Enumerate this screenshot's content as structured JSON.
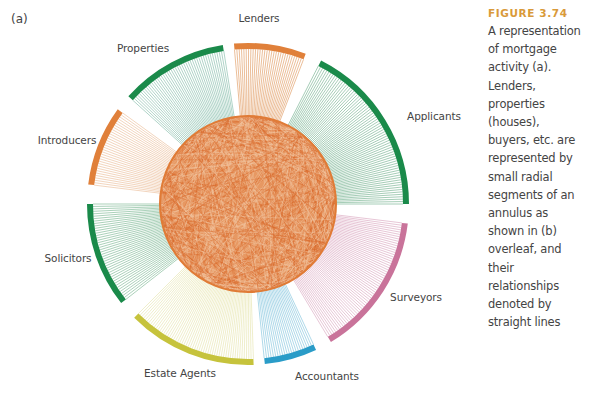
{
  "figure": {
    "panel_label": "(a)",
    "center": [
      248,
      204
    ],
    "inner_radius": 88,
    "outer_radius": 158,
    "arc_width": 6,
    "hub_color": "#e07b36",
    "segments": [
      {
        "name": "Lenders",
        "start": -95,
        "end": -69,
        "color": "#e0803a",
        "spoke_color": "#e2a26d",
        "spokes": 30,
        "label_pos": [
          259,
          18
        ]
      },
      {
        "name": "Applicants",
        "start": -63,
        "end": 0,
        "color": "#1a8a4a",
        "spoke_color": "#7fb898",
        "spokes": 70,
        "label_pos": [
          434,
          116
        ]
      },
      {
        "name": "Surveyors",
        "start": 7,
        "end": 59,
        "color": "#c9739a",
        "spoke_color": "#dcaec4",
        "spokes": 60,
        "label_pos": [
          416,
          297
        ]
      },
      {
        "name": "Accountants",
        "start": 65,
        "end": 84,
        "color": "#2a9cc8",
        "spoke_color": "#8cc8e0",
        "spokes": 22,
        "label_pos": [
          327,
          376
        ]
      },
      {
        "name": "Estate Agents",
        "start": 88,
        "end": 135,
        "color": "#c6c33c",
        "spoke_color": "#e8e6b4",
        "spokes": 55,
        "label_pos": [
          180,
          373
        ]
      },
      {
        "name": "Solicitors",
        "start": 142,
        "end": 180,
        "color": "#1a8a4a",
        "spoke_color": "#86bd9c",
        "spokes": 42,
        "label_pos": [
          68,
          258
        ]
      },
      {
        "name": "Introducers",
        "start": -173,
        "end": -144,
        "color": "#e0803a",
        "spoke_color": "#edc3a2",
        "spokes": 32,
        "label_pos": [
          67,
          140
        ]
      },
      {
        "name": "Properties",
        "start": -138,
        "end": -99,
        "color": "#1a8a4a",
        "spoke_color": "#8ec2b0",
        "spokes": 45,
        "label_pos": [
          143,
          48
        ]
      }
    ]
  },
  "caption": {
    "title": "FIGURE 3.74",
    "lines": [
      "A representation",
      "of mortgage",
      "activity (a).",
      "Lenders,",
      "properties",
      "(houses),",
      "buyers, etc. are",
      "represented by",
      "small radial",
      "segments of an",
      "annulus as",
      "shown in (b)",
      "overleaf, and",
      "their",
      "relationships",
      "denoted by",
      "straight lines"
    ]
  }
}
